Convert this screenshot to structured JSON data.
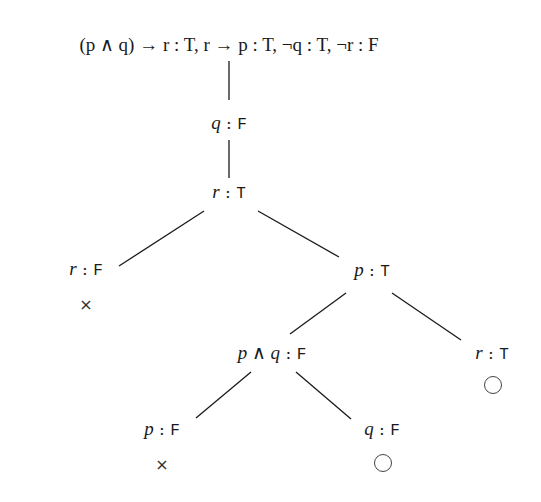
{
  "root": {
    "label": "(p ∧ q) → r : T, r → p : T, ¬q : T, ¬r : F",
    "parts": [
      {
        "formula": "(p ∧ q) → r",
        "value": "T"
      },
      {
        "formula": "r → p",
        "value": "T"
      },
      {
        "formula": "¬q",
        "value": "T"
      },
      {
        "formula": "¬r",
        "value": "F"
      }
    ]
  },
  "nodes": {
    "n1": {
      "formula": "q",
      "value": "F"
    },
    "n2": {
      "formula": "r",
      "value": "T"
    },
    "n3": {
      "formula": "r",
      "value": "F",
      "status": "closed",
      "mark": "×"
    },
    "n4": {
      "formula": "p",
      "value": "T"
    },
    "n5": {
      "formula": "p ∧ q",
      "value": "F"
    },
    "n6": {
      "formula": "r",
      "value": "T",
      "status": "open",
      "mark": "○"
    },
    "n7": {
      "formula": "p",
      "value": "F",
      "status": "closed",
      "mark": "×"
    },
    "n8": {
      "formula": "q",
      "value": "F",
      "status": "open",
      "mark": "○"
    }
  },
  "separator": " : ",
  "comma": ", "
}
